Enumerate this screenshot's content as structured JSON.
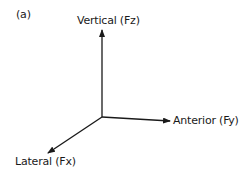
{
  "diagram": {
    "panel_label": "(a)",
    "type": "3D force axes",
    "origin": {
      "x": 102,
      "y": 117
    },
    "axes": [
      {
        "id": "vertical",
        "label": "Vertical (Fz)",
        "end": {
          "x": 102,
          "y": 29
        }
      },
      {
        "id": "anterior",
        "label": "Anterior (Fy)",
        "end": {
          "x": 171,
          "y": 121
        }
      },
      {
        "id": "lateral",
        "label": "Lateral (Fx)",
        "end": {
          "x": 47,
          "y": 154
        }
      }
    ],
    "colors": {
      "line": "#1a1a1a",
      "background": "#ffffff"
    }
  }
}
